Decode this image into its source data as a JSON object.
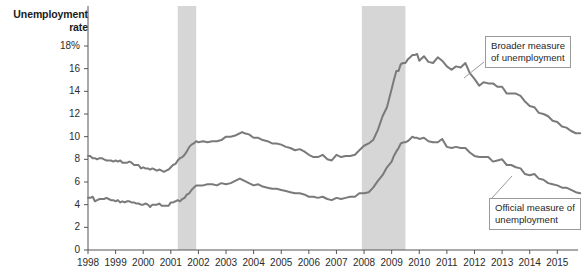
{
  "chart_data": {
    "type": "line",
    "title": "Unemployment rate",
    "xlabel": "",
    "ylabel": "Unemployment rate",
    "ylim": [
      0,
      18
    ],
    "xlim": [
      1998,
      2015.75
    ],
    "grid": false,
    "legend_position": "annotations-inline",
    "y_ticks": [
      "18%",
      "16",
      "14",
      "12",
      "10",
      "8",
      "6",
      "4",
      "2",
      "0"
    ],
    "y_tick_values": [
      18,
      16,
      14,
      12,
      10,
      8,
      6,
      4,
      2,
      0
    ],
    "x_ticks": [
      "1998",
      "1999",
      "2000",
      "2001",
      "2002",
      "2003",
      "2004",
      "2005",
      "2006",
      "2007",
      "2008",
      "2009",
      "2010",
      "2011",
      "2012",
      "2013",
      "2014",
      "2015"
    ],
    "x_tick_values": [
      1998,
      1999,
      2000,
      2001,
      2002,
      2003,
      2004,
      2005,
      2006,
      2007,
      2008,
      2009,
      2010,
      2011,
      2012,
      2013,
      2014,
      2015
    ],
    "series": [
      {
        "name": "Broader measure of unemployment",
        "color": "#7a7a7a",
        "x": [
          1998.0,
          1998.08,
          1998.17,
          1998.25,
          1998.33,
          1998.42,
          1998.5,
          1998.58,
          1998.67,
          1998.75,
          1998.83,
          1998.92,
          1999.0,
          1999.08,
          1999.17,
          1999.25,
          1999.33,
          1999.42,
          1999.5,
          1999.58,
          1999.67,
          1999.75,
          1999.83,
          1999.92,
          2000.0,
          2000.08,
          2000.17,
          2000.25,
          2000.33,
          2000.42,
          2000.5,
          2000.58,
          2000.67,
          2000.75,
          2000.83,
          2000.92,
          2001.0,
          2001.08,
          2001.17,
          2001.25,
          2001.33,
          2001.42,
          2001.5,
          2001.58,
          2001.67,
          2001.75,
          2001.83,
          2001.92,
          2002.0,
          2002.17,
          2002.33,
          2002.5,
          2002.67,
          2002.83,
          2003.0,
          2003.17,
          2003.33,
          2003.5,
          2003.58,
          2003.67,
          2003.83,
          2004.0,
          2004.17,
          2004.33,
          2004.5,
          2004.67,
          2004.83,
          2005.0,
          2005.17,
          2005.33,
          2005.5,
          2005.67,
          2005.83,
          2006.0,
          2006.17,
          2006.33,
          2006.5,
          2006.67,
          2006.83,
          2007.0,
          2007.17,
          2007.33,
          2007.5,
          2007.67,
          2007.83,
          2008.0,
          2008.17,
          2008.33,
          2008.5,
          2008.67,
          2008.83,
          2009.0,
          2009.08,
          2009.17,
          2009.25,
          2009.33,
          2009.42,
          2009.5,
          2009.58,
          2009.67,
          2009.75,
          2009.83,
          2009.92,
          2010.0,
          2010.17,
          2010.33,
          2010.5,
          2010.67,
          2010.83,
          2011.0,
          2011.17,
          2011.33,
          2011.5,
          2011.67,
          2011.83,
          2012.0,
          2012.17,
          2012.33,
          2012.5,
          2012.67,
          2012.83,
          2013.0,
          2013.17,
          2013.33,
          2013.5,
          2013.67,
          2013.83,
          2014.0,
          2014.17,
          2014.33,
          2014.5,
          2014.67,
          2014.83,
          2015.0,
          2015.17,
          2015.33,
          2015.5,
          2015.67,
          2015.83
        ],
        "values": [
          8.3,
          8.3,
          8.1,
          8.1,
          8.0,
          8.1,
          8.1,
          8.0,
          7.9,
          7.9,
          7.9,
          7.8,
          7.9,
          7.8,
          7.9,
          7.7,
          7.7,
          7.7,
          7.8,
          7.7,
          7.5,
          7.5,
          7.5,
          7.2,
          7.3,
          7.2,
          7.2,
          7.1,
          7.2,
          7.1,
          7.0,
          7.1,
          7.0,
          6.9,
          7.0,
          7.1,
          7.3,
          7.5,
          7.6,
          7.9,
          8.1,
          8.2,
          8.4,
          8.7,
          9.1,
          9.3,
          9.4,
          9.6,
          9.5,
          9.6,
          9.5,
          9.6,
          9.6,
          9.7,
          10.0,
          10.0,
          10.1,
          10.3,
          10.4,
          10.3,
          10.2,
          9.9,
          9.9,
          9.7,
          9.6,
          9.4,
          9.4,
          9.3,
          9.1,
          9.0,
          8.8,
          8.9,
          8.7,
          8.4,
          8.2,
          8.2,
          8.4,
          8.0,
          7.9,
          8.4,
          8.2,
          8.3,
          8.3,
          8.4,
          8.8,
          9.2,
          9.4,
          9.7,
          10.6,
          11.8,
          12.6,
          14.2,
          15.0,
          15.8,
          15.8,
          16.4,
          16.5,
          16.5,
          16.8,
          17.0,
          17.2,
          17.2,
          17.3,
          16.7,
          17.1,
          16.6,
          16.5,
          17.0,
          16.7,
          16.2,
          15.9,
          16.2,
          16.1,
          16.5,
          15.6,
          15.1,
          14.5,
          14.8,
          14.7,
          14.7,
          14.4,
          14.4,
          13.8,
          13.8,
          13.8,
          13.6,
          13.1,
          12.7,
          12.6,
          12.1,
          12.0,
          11.8,
          11.4,
          11.3,
          10.9,
          10.8,
          10.5,
          10.3,
          10.3
        ]
      },
      {
        "name": "Official measure of unemployment",
        "color": "#7a7a7a",
        "x": [
          1998.0,
          1998.08,
          1998.17,
          1998.25,
          1998.33,
          1998.42,
          1998.5,
          1998.58,
          1998.67,
          1998.75,
          1998.83,
          1998.92,
          1999.0,
          1999.08,
          1999.17,
          1999.25,
          1999.33,
          1999.42,
          1999.5,
          1999.58,
          1999.67,
          1999.75,
          1999.83,
          1999.92,
          2000.0,
          2000.08,
          2000.17,
          2000.25,
          2000.33,
          2000.42,
          2000.5,
          2000.58,
          2000.67,
          2000.75,
          2000.83,
          2000.92,
          2001.0,
          2001.08,
          2001.17,
          2001.25,
          2001.33,
          2001.42,
          2001.5,
          2001.58,
          2001.67,
          2001.75,
          2001.83,
          2001.92,
          2002.0,
          2002.17,
          2002.33,
          2002.5,
          2002.67,
          2002.83,
          2003.0,
          2003.17,
          2003.33,
          2003.5,
          2003.58,
          2003.67,
          2003.83,
          2004.0,
          2004.17,
          2004.33,
          2004.5,
          2004.67,
          2004.83,
          2005.0,
          2005.17,
          2005.33,
          2005.5,
          2005.67,
          2005.83,
          2006.0,
          2006.17,
          2006.33,
          2006.5,
          2006.67,
          2006.83,
          2007.0,
          2007.17,
          2007.33,
          2007.5,
          2007.67,
          2007.83,
          2008.0,
          2008.17,
          2008.33,
          2008.5,
          2008.67,
          2008.83,
          2009.0,
          2009.08,
          2009.17,
          2009.25,
          2009.33,
          2009.42,
          2009.5,
          2009.58,
          2009.67,
          2009.75,
          2009.83,
          2009.92,
          2010.0,
          2010.17,
          2010.33,
          2010.5,
          2010.67,
          2010.83,
          2011.0,
          2011.17,
          2011.33,
          2011.5,
          2011.67,
          2011.83,
          2012.0,
          2012.17,
          2012.33,
          2012.5,
          2012.67,
          2012.83,
          2013.0,
          2013.17,
          2013.33,
          2013.5,
          2013.67,
          2013.83,
          2014.0,
          2014.17,
          2014.33,
          2014.5,
          2014.67,
          2014.83,
          2015.0,
          2015.17,
          2015.33,
          2015.5,
          2015.67,
          2015.83
        ],
        "values": [
          4.6,
          4.6,
          4.7,
          4.3,
          4.4,
          4.5,
          4.5,
          4.5,
          4.6,
          4.5,
          4.4,
          4.4,
          4.3,
          4.4,
          4.2,
          4.3,
          4.2,
          4.3,
          4.3,
          4.2,
          4.2,
          4.1,
          4.1,
          4.0,
          4.0,
          4.1,
          4.0,
          3.8,
          4.0,
          4.0,
          4.0,
          4.1,
          3.9,
          3.9,
          3.9,
          3.9,
          4.2,
          4.2,
          4.3,
          4.4,
          4.3,
          4.5,
          4.6,
          4.9,
          5.0,
          5.3,
          5.5,
          5.7,
          5.7,
          5.7,
          5.8,
          5.8,
          5.7,
          5.9,
          5.8,
          5.9,
          6.1,
          6.3,
          6.2,
          6.1,
          5.9,
          5.7,
          5.8,
          5.6,
          5.5,
          5.4,
          5.4,
          5.3,
          5.2,
          5.1,
          5.0,
          5.0,
          4.9,
          4.7,
          4.7,
          4.6,
          4.7,
          4.5,
          4.4,
          4.6,
          4.5,
          4.6,
          4.7,
          4.7,
          5.0,
          5.0,
          5.1,
          5.5,
          6.1,
          6.6,
          7.3,
          7.8,
          8.3,
          8.7,
          9.0,
          9.4,
          9.5,
          9.5,
          9.6,
          9.8,
          10.0,
          9.9,
          9.9,
          9.8,
          9.9,
          9.6,
          9.5,
          9.5,
          9.8,
          9.1,
          9.0,
          9.1,
          9.0,
          9.0,
          8.6,
          8.3,
          8.2,
          8.2,
          8.2,
          7.8,
          7.9,
          8.0,
          7.5,
          7.5,
          7.3,
          7.2,
          6.7,
          6.6,
          6.7,
          6.3,
          6.2,
          5.9,
          5.8,
          5.7,
          5.5,
          5.5,
          5.3,
          5.1,
          5.0
        ]
      }
    ],
    "shaded_regions": [
      {
        "name": "recession-2001",
        "start": 2001.25,
        "end": 2001.92,
        "color": "#d6d6d6"
      },
      {
        "name": "recession-2008",
        "start": 2007.92,
        "end": 2009.5,
        "color": "#d6d6d6"
      }
    ],
    "annotations": [
      {
        "name": "broader-callout",
        "lines": [
          "Broader measure",
          "of unemployment"
        ]
      },
      {
        "name": "official-callout",
        "lines": [
          "Official measure of",
          "unemployment"
        ]
      }
    ]
  },
  "axis": {
    "title_line1": "Unemployment",
    "title_line2": "rate"
  },
  "callouts": {
    "broader_line1": "Broader measure",
    "broader_line2": "of unemployment",
    "official_line1": "Official measure of",
    "official_line2": "unemployment"
  },
  "colors": {
    "line": "#7a7a7a",
    "axis": "#555555",
    "band": "#d6d6d6",
    "text": "#1f1f1f"
  }
}
